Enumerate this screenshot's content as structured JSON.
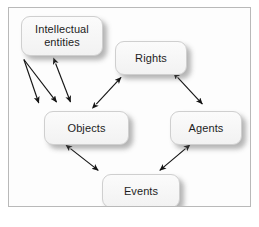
{
  "figure": {
    "type": "diagram",
    "diagram_kind": "entity-relationship / conceptual model",
    "caption": "",
    "nodes": [
      {
        "id": "intellectual_entities",
        "label": "Intellectual\nentities",
        "label_line1": "Intellectual",
        "label_line2": "entities"
      },
      {
        "id": "rights",
        "label": "Rights"
      },
      {
        "id": "objects",
        "label": "Objects"
      },
      {
        "id": "agents",
        "label": "Agents"
      },
      {
        "id": "events",
        "label": "Events"
      }
    ],
    "edges": [
      {
        "from": "intellectual_entities",
        "to": "objects",
        "arrow": "double"
      },
      {
        "from": "intellectual_entities",
        "to": "objects",
        "arrow": "single",
        "note": "fan arrow 1 from common origin"
      },
      {
        "from": "intellectual_entities",
        "to": "objects",
        "arrow": "single",
        "note": "fan arrow 2 from common origin"
      },
      {
        "from": "objects",
        "to": "rights",
        "arrow": "double"
      },
      {
        "from": "rights",
        "to": "agents",
        "arrow": "double"
      },
      {
        "from": "objects",
        "to": "events",
        "arrow": "double"
      },
      {
        "from": "agents",
        "to": "events",
        "arrow": "double"
      }
    ],
    "colors": {
      "node_fill": "#f7f7f7",
      "node_border": "#cfcfcf",
      "frame_border": "#b9b9b9",
      "background": "#ffffff",
      "edge_stroke": "#1a1a1a",
      "text": "#1d1d1d"
    }
  }
}
